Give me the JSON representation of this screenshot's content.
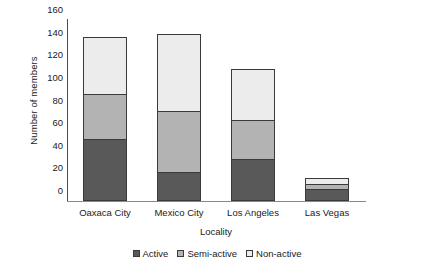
{
  "chart_data": {
    "type": "bar",
    "subtype": "stacked",
    "title": "",
    "xlabel": "Locality",
    "ylabel": "Number of members",
    "categories": [
      "Oaxaca City",
      "Mexico City",
      "Los Angeles",
      "Las Vegas"
    ],
    "series": [
      {
        "name": "Active",
        "values": [
          55,
          26,
          37,
          11
        ],
        "color": "#595959"
      },
      {
        "name": "Semi-active",
        "values": [
          40,
          54,
          35,
          4
        ],
        "color": "#b3b3b3"
      },
      {
        "name": "Non-active",
        "values": [
          50,
          68,
          45,
          5
        ],
        "color": "#ececec"
      }
    ],
    "totals": [
      145,
      148,
      117,
      20
    ],
    "ylim": [
      0,
      160
    ],
    "yticks": [
      0,
      20,
      40,
      60,
      80,
      100,
      120,
      140,
      160
    ],
    "ytick_labels": [
      "0",
      "20",
      "40",
      "60",
      "80",
      "100",
      "120",
      "140",
      "160"
    ],
    "grid": false,
    "legend_position": "bottom"
  }
}
